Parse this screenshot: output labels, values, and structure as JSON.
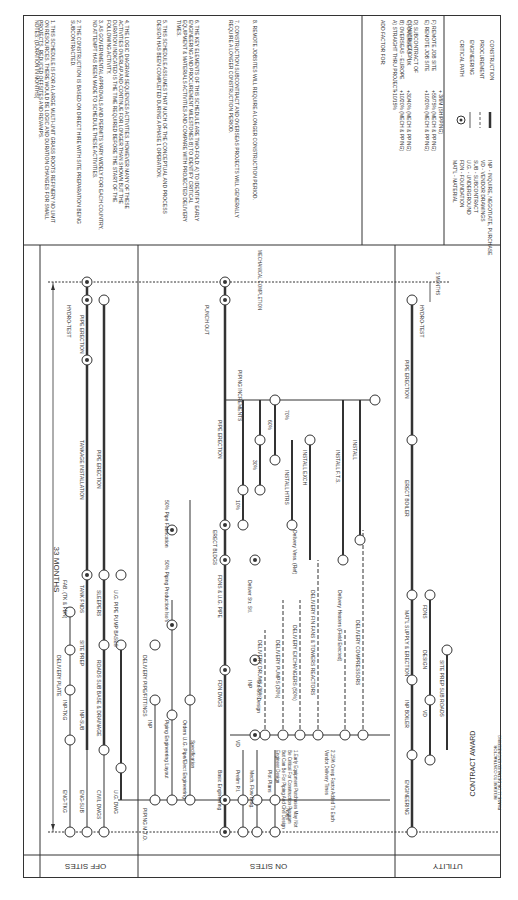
{
  "notes": {
    "heading": "NOTES: (DURATION IN MONTHS)",
    "items": [
      "1. THIS SCHEDULE IS FOR A LARGE MULTI-UNIT GRASS ROOTS REFINERY NO LIMIT ON RESOURCES. THERE WOULD BE LOGIC AND DURATION CHANGES FOR SMALL PROJECTS, REDUCED OFFSITES AND REVAMPS.",
      "2. THE CONSTRUCTION IS BASED ON DIRECT HIRE WITH SITE PREPARATION BEING SUBCONTRACTED.",
      "3. AS GOVERNMENTAL APPROVALS AND PERMITS VARY WIDELY FOR EACH COUNTRY, NO ATTEMPT HAS BEEN MADE TO SCHEDULE THESE ACTIVITIES.",
      "4. THE LOGIC DIAGRAM SEQUENCES ACTIVITIES. HOWEVER MANY OF THESE ACTIVITIES OVERLAP AND CONTINUE FOR LONGER THAN SHOWN BUT THE DURATION INDICATED IS THE TIME REQUIRED BEFORE THE START OF THE FOLLOWING ACTIVITY.",
      "5. THIS SCHEDULE ASSUMES THAT MUCH OF THE CONCEPTUAL AND PROCESS DESIGN HAS BEEN COMPLETED DURING A PHASE 1 OPERATION.",
      "6. THE KEY ELEMENTS OF THIS SCHEDULE ARE TWO-FOLD: A) TO IDENTIFY EARLY ENGINEERING AND PROCUREMENT MILESTONES B) TO IDENTIFY CRITICAL EQUIPMENT & MATERIALS ACTIVITIES AND COMPARE WITH PROJECTED DELIVERY TIMES.",
      "7. CONSTRUCTION SUBCONTRACT AND OVERSEAS PROJECTS WILL GENERALLY REQUIRE A LONGER CONSTRUCTION PERIOD.",
      "8. REMOTE JOBSITES WILL REQUIRE A LONGER CONSTRUCTION PERIOD."
    ]
  },
  "add_factor": {
    "heading": "ADD FACTOR FOR:",
    "rows": [
      {
        "label": "A) STRAIGHT THRU PROJECT",
        "value": "+10/15%"
      },
      {
        "label": "B) OVERSEAS - EUROPE",
        "value": "+10/20% (MECH & PPING)"
      },
      {
        "label": "C) OVERSEAS - UK",
        "value": "+30/40% (MECH & PPING)"
      },
      {
        "label": "D) SUBCONTRACT OF CONSTRUCTION",
        "value": ""
      },
      {
        "label": "E) REMOTE JOB SITE",
        "value": "+10/20% (MECH & PPING)"
      },
      {
        "label": "F) REMOTE JOB SITE",
        "value": "+55/75% (MECH & PPING)"
      },
      {
        "label": "",
        "value": "+ 3/6M (SHIPPING)"
      }
    ]
  },
  "abbreviations": [
    "MAT'L - MATERIAL",
    "FDN - FOUNDATION",
    "U.G. - UNDERGROUND",
    "SUB - SUBCONTRACT",
    "VD - VENDOR DRAWINGS",
    "INP - INQUIRE, NEGOTIATE, PURCHASE"
  ],
  "legend": [
    {
      "symbol": "circle-dot",
      "label": "CRITICAL PATH"
    },
    {
      "symbol": "thin-line",
      "label": "ENGINEERING"
    },
    {
      "symbol": "dashed-line",
      "label": "PROCUREMENT"
    },
    {
      "symbol": "thick-line",
      "label": "CONSTRUCTION"
    }
  ],
  "header": {
    "duration": "33 MONTHS",
    "mech_completion": "MECHANICAL COMPLETION",
    "three_months": "3 MONTHS",
    "contract_award": "CONTRACT AWARD",
    "contract_award_sub1": "PHASE 11 OR DETAILED ENGINEERING",
    "contract_award_sub2": "RELEASE TO CONTRACTOR"
  },
  "sections": [
    {
      "label": "OFF SITES"
    },
    {
      "label": "ON SITES"
    },
    {
      "label": "UTILITY"
    }
  ],
  "offsites_activities": [
    "ENG-TKG",
    "INP-TKG",
    "DELIVERY PLATE",
    "FAB. (TK & FDN)",
    "ENG-SUB",
    "INP-SUB",
    "SITE PREP",
    "TANK FNDS",
    "TANKAGE INSTALLATION",
    "HYDRO-TEST",
    "PIPE ERECTION",
    "CIVIL DWGS",
    "U.G. DWG",
    "ROADS SUB BASE & DRAINAGE",
    "SLEEPERS",
    "U.G. PIPE PUMP BASES",
    "PIPE ERECTION"
  ],
  "onsites_activities": [
    "Basic Engineering",
    "Prelim P.I.",
    "Mech. Flow Diag.",
    "Plot Plans",
    "PIPING M.T.O.",
    "INP",
    "DELIVERY PIPE/FITTINGS",
    "Piping Engineering Layout",
    "Orders U.G. Pipe/Elect Engineering",
    "50% Piping Production Iso's",
    "50% Pipe Fabrication",
    "FDN DWGS",
    "FDNS & U.G. PIPE",
    "ERECT BLDGS",
    "PIPE ERECTION",
    "PUNCH OUT",
    "PIPING INCREMENTS",
    "10%",
    "30%",
    "60%",
    "70%",
    "Deliver Str. Stl.",
    "Delivery Vess. (Ref)",
    "INSTALL HTRS",
    "INSTALL EXCH",
    "INSTALL F.T.S.",
    "INSTALL",
    "DELIVERY DRUMS (30%)",
    "DELIVERY PUMPS (30%)",
    "DELIVERY EXCHANGERS (50%)",
    "DELIVERY FIN FANS & TOWERS REACTORS",
    "Delivery Heaters (Field Erected)",
    "DELIVERY COMPRESSORS",
    "VD",
    "INP",
    "Str. Stl. Design",
    "Specification"
  ],
  "onsites_footnotes": {
    "heading": "Notes",
    "items": [
      "1.Early Equipment Purchases May Not Be Critical For Construction Program But Can Be For Piping And Civil Design Engineer Design",
      "2.15% Creep Factor Added To Each Vendor Delivery Times"
    ]
  },
  "utility_activities": [
    "ENGINEERING",
    "INP BOILER",
    "MAT'L SUPPLY & ERECTION",
    "VD",
    "DESIGN",
    "FDNS",
    "SITE PREP SUB ROADS",
    "ERECT BOILER",
    "PIPE ERECTION",
    "HYDRO-TEST"
  ]
}
